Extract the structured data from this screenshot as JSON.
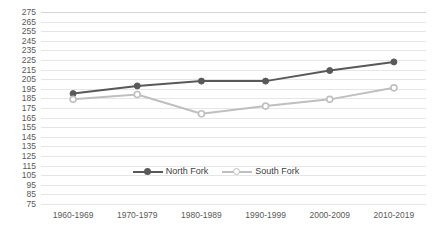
{
  "chart_data": {
    "type": "line",
    "title": "",
    "xlabel": "",
    "ylabel": "",
    "categories": [
      "1960-1969",
      "1970-1979",
      "1980-1989",
      "1990-1999",
      "2000-2009",
      "2010-2019"
    ],
    "series": [
      {
        "name": "North Fork",
        "color": "#595959",
        "marker": "filled-circle",
        "values": [
          190,
          198,
          203,
          203,
          214,
          223
        ]
      },
      {
        "name": "South Fork",
        "color": "#bfbfbf",
        "marker": "open-circle",
        "values": [
          184,
          189,
          169,
          177,
          184,
          196
        ]
      }
    ],
    "ylim": [
      75,
      275
    ],
    "ytick_step": 10,
    "yticks": [
      275,
      265,
      255,
      245,
      235,
      225,
      215,
      205,
      195,
      185,
      175,
      165,
      155,
      145,
      135,
      125,
      115,
      105,
      95,
      85,
      75
    ],
    "grid": true,
    "grid_color": "#e6e6e6",
    "legend_position": "bottom-center",
    "background": "#ffffff",
    "axis_label_color": "#595959"
  },
  "legend": {
    "entries": [
      {
        "label": "North Fork"
      },
      {
        "label": "South Fork"
      }
    ]
  }
}
